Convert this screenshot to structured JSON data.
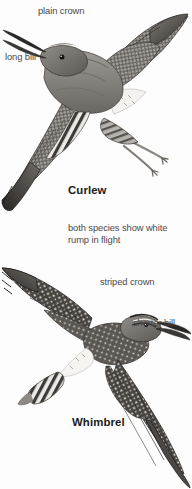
{
  "plate": {
    "kind": "bird-identification-plate",
    "background_color": "#fdfdfd",
    "ink_color": "#4a4a4a",
    "heading_color": "#1b1b1b"
  },
  "annotations": {
    "plain_crown": "plain crown",
    "long_bill": "long bill",
    "rump_note_line1": "both species show white",
    "rump_note_line2": "rump in flight",
    "striped_crown": "striped crown",
    "shorter_bill": "shorter bill"
  },
  "species": {
    "curlew": "Curlew",
    "whimbrel": "Whimbrel"
  },
  "figures": {
    "curlew_label": "curlew-in-flight-illustration",
    "whimbrel_label": "whimbrel-in-flight-illustration"
  }
}
